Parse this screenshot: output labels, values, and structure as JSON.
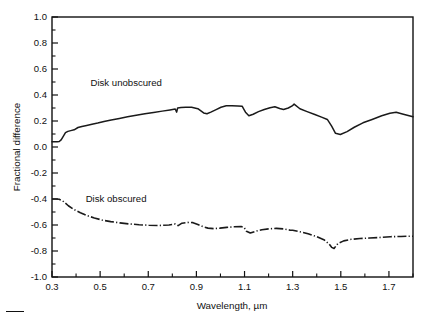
{
  "figure": {
    "background": "#ffffff",
    "ink_color": "#1a1a1a"
  },
  "chart_data": {
    "type": "line",
    "title": "",
    "xlabel": "Wavelength, µm",
    "ylabel": "Fractional difference",
    "xlim": [
      0.3,
      1.8
    ],
    "ylim": [
      -1.0,
      1.0
    ],
    "grid": false,
    "legend_position": "inline-annotation",
    "xticks": [
      0.3,
      0.5,
      0.7,
      0.9,
      1.1,
      1.3,
      1.5,
      1.7
    ],
    "xtick_labels": [
      "0.3",
      "0.5",
      "0.7",
      "0.9",
      "1.1",
      "1.3",
      "1.5",
      "1.7"
    ],
    "xticks_minor": [
      0.4,
      0.6,
      0.8,
      1.0,
      1.2,
      1.4,
      1.6,
      1.8
    ],
    "yticks": [
      -1.0,
      -0.8,
      -0.6,
      -0.4,
      -0.2,
      0.0,
      0.2,
      0.4,
      0.6,
      0.8,
      1.0
    ],
    "ytick_labels": [
      "-1.0",
      "-0.8",
      "-0.6",
      "-0.4",
      "-0.2",
      "0.0",
      "0.2",
      "0.4",
      "0.6",
      "0.8",
      "1.0"
    ],
    "yticks_minor": [
      -0.9,
      -0.7,
      -0.5,
      -0.3,
      -0.1,
      0.1,
      0.3,
      0.5,
      0.7,
      0.9
    ],
    "series": [
      {
        "name": "Disk unobscured",
        "label": "Disk unobscured",
        "linestyle": "solid",
        "annotation_x": 0.46,
        "annotation_y": 0.47,
        "x": [
          0.3,
          0.312,
          0.322,
          0.33,
          0.338,
          0.348,
          0.356,
          0.366,
          0.378,
          0.392,
          0.408,
          0.424,
          0.444,
          0.466,
          0.49,
          0.516,
          0.546,
          0.58,
          0.614,
          0.65,
          0.686,
          0.722,
          0.758,
          0.79,
          0.812,
          0.818,
          0.822,
          0.836,
          0.856,
          0.88,
          0.906,
          0.93,
          0.944,
          0.96,
          0.982,
          1.002,
          1.024,
          1.048,
          1.072,
          1.09,
          1.098,
          1.104,
          1.118,
          1.136,
          1.158,
          1.182,
          1.206,
          1.226,
          1.246,
          1.262,
          1.282,
          1.298,
          1.306,
          1.33,
          1.36,
          1.392,
          1.42,
          1.444,
          1.452,
          1.462,
          1.478,
          1.498,
          1.526,
          1.556,
          1.592,
          1.63,
          1.67,
          1.704,
          1.73,
          1.76,
          1.8
        ],
        "y": [
          0.04,
          0.04,
          0.041,
          0.042,
          0.055,
          0.085,
          0.11,
          0.12,
          0.126,
          0.132,
          0.15,
          0.158,
          0.166,
          0.175,
          0.184,
          0.196,
          0.208,
          0.22,
          0.232,
          0.245,
          0.256,
          0.266,
          0.276,
          0.285,
          0.292,
          0.268,
          0.3,
          0.303,
          0.305,
          0.306,
          0.295,
          0.262,
          0.256,
          0.268,
          0.288,
          0.306,
          0.317,
          0.318,
          0.316,
          0.314,
          0.288,
          0.268,
          0.24,
          0.252,
          0.272,
          0.288,
          0.302,
          0.31,
          0.296,
          0.288,
          0.3,
          0.316,
          0.33,
          0.294,
          0.272,
          0.25,
          0.23,
          0.212,
          0.19,
          0.16,
          0.105,
          0.096,
          0.118,
          0.152,
          0.186,
          0.212,
          0.24,
          0.26,
          0.268,
          0.252,
          0.232
        ]
      },
      {
        "name": "Disk obscured",
        "label": "Disk obscured",
        "linestyle": "dash-dot",
        "annotation_x": 0.44,
        "annotation_y": -0.4,
        "x": [
          0.3,
          0.316,
          0.33,
          0.348,
          0.368,
          0.392,
          0.418,
          0.446,
          0.476,
          0.508,
          0.544,
          0.582,
          0.622,
          0.662,
          0.702,
          0.744,
          0.786,
          0.812,
          0.824,
          0.84,
          0.862,
          0.886,
          0.906,
          0.926,
          0.948,
          0.972,
          0.998,
          1.026,
          1.056,
          1.086,
          1.098,
          1.108,
          1.124,
          1.146,
          1.172,
          1.2,
          1.232,
          1.262,
          1.29,
          1.3,
          1.33,
          1.364,
          1.4,
          1.432,
          1.452,
          1.462,
          1.472,
          1.488,
          1.512,
          1.544,
          1.58,
          1.62,
          1.662,
          1.706,
          1.75,
          1.8
        ],
        "y": [
          -0.4,
          -0.4,
          -0.402,
          -0.42,
          -0.452,
          -0.482,
          -0.506,
          -0.528,
          -0.546,
          -0.562,
          -0.574,
          -0.584,
          -0.592,
          -0.598,
          -0.602,
          -0.604,
          -0.6,
          -0.592,
          -0.605,
          -0.586,
          -0.58,
          -0.582,
          -0.596,
          -0.612,
          -0.624,
          -0.628,
          -0.624,
          -0.618,
          -0.614,
          -0.612,
          -0.618,
          -0.648,
          -0.662,
          -0.648,
          -0.636,
          -0.63,
          -0.626,
          -0.63,
          -0.64,
          -0.64,
          -0.652,
          -0.668,
          -0.69,
          -0.716,
          -0.748,
          -0.772,
          -0.78,
          -0.742,
          -0.722,
          -0.71,
          -0.704,
          -0.7,
          -0.696,
          -0.69,
          -0.688,
          -0.686
        ]
      }
    ]
  }
}
